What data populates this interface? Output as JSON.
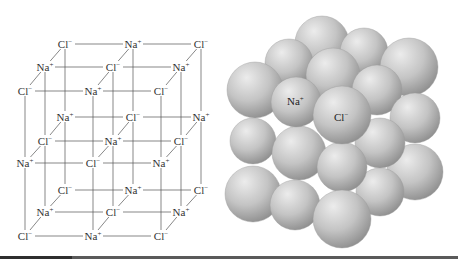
{
  "figure": {
    "left_panel": {
      "name": "NaCl lattice ball-and-stick diagram",
      "ions": {
        "Na": {
          "symbol": "Na",
          "charge": "+"
        },
        "Cl": {
          "symbol": "Cl",
          "charge": "−"
        }
      },
      "geometry": {
        "front_row_x": [
          25,
          93,
          161
        ],
        "depth_dx": 20,
        "layers_y": [
          {
            "back": 44,
            "mid": 67,
            "front": 91
          },
          {
            "back": 117,
            "mid": 141,
            "front": 163
          },
          {
            "back": 190,
            "mid": 212,
            "front": 236
          }
        ]
      },
      "layers": [
        {
          "name": "top",
          "back": [
            "Cl",
            "Na",
            "Cl"
          ],
          "mid": [
            "Na",
            "Cl",
            "Na"
          ],
          "front": [
            "Cl",
            "Na",
            "Cl"
          ]
        },
        {
          "name": "middle",
          "back": [
            "Na",
            "Cl",
            "Na"
          ],
          "mid": [
            "Cl",
            "Na",
            "Cl"
          ],
          "front": [
            "Na",
            "Cl",
            "Na"
          ]
        },
        {
          "name": "bottom",
          "back": [
            "Cl",
            "Na",
            "Cl"
          ],
          "mid": [
            "Na",
            "Cl",
            "Na"
          ],
          "front": [
            "Cl",
            "Na",
            "Cl"
          ]
        }
      ]
    },
    "right_panel": {
      "name": "NaCl space-filling model",
      "labels": [
        {
          "text": "Na",
          "sup": "+",
          "x": 287,
          "y": 105
        },
        {
          "text": "Cl",
          "sup": "−",
          "x": 334,
          "y": 121
        }
      ],
      "spheres": [
        {
          "cx": 322,
          "cy": 43,
          "r": 27
        },
        {
          "cx": 364,
          "cy": 52,
          "r": 24
        },
        {
          "cx": 289,
          "cy": 63,
          "r": 24
        },
        {
          "cx": 409,
          "cy": 67,
          "r": 29
        },
        {
          "cx": 333,
          "cy": 75,
          "r": 27
        },
        {
          "cx": 377,
          "cy": 90,
          "r": 25
        },
        {
          "cx": 415,
          "cy": 118,
          "r": 25
        },
        {
          "cx": 255,
          "cy": 90,
          "r": 28
        },
        {
          "cx": 415,
          "cy": 172,
          "r": 28
        },
        {
          "cx": 380,
          "cy": 143,
          "r": 25
        },
        {
          "cx": 380,
          "cy": 192,
          "r": 24
        },
        {
          "cx": 253,
          "cy": 141,
          "r": 23
        },
        {
          "cx": 253,
          "cy": 194,
          "r": 28
        },
        {
          "cx": 299,
          "cy": 153,
          "r": 27
        },
        {
          "cx": 342,
          "cy": 167,
          "r": 25
        },
        {
          "cx": 296,
          "cy": 102,
          "r": 25
        },
        {
          "cx": 342,
          "cy": 115,
          "r": 29
        },
        {
          "cx": 295,
          "cy": 205,
          "r": 25
        },
        {
          "cx": 342,
          "cy": 219,
          "r": 29
        }
      ],
      "colors": {
        "highlight": "#ececec",
        "mid": "#c4c4c4",
        "shadow": "#8e8e8e"
      }
    }
  }
}
